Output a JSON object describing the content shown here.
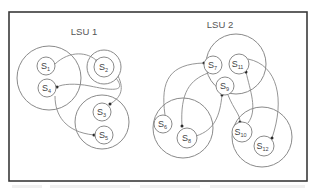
{
  "diagram": {
    "frame": {
      "x": 9,
      "y": 12,
      "width": 298,
      "height": 169,
      "color": "#3a3a3a"
    },
    "stroke_color": "#8a8a8a",
    "arrow_color": "#2b2b2b",
    "lsus": [
      {
        "id": "lsu1",
        "label": "LSU 1",
        "x": 84,
        "y": 35
      },
      {
        "id": "lsu2",
        "label": "LSU 2",
        "x": 220,
        "y": 28
      }
    ],
    "groups": [
      {
        "id": "g1",
        "lsu": "lsu1",
        "cx": 49,
        "cy": 78,
        "r": 32,
        "states": [
          "S1",
          "S4"
        ]
      },
      {
        "id": "g2",
        "lsu": "lsu1",
        "cx": 104,
        "cy": 67,
        "r": 17,
        "states": [
          "S2"
        ]
      },
      {
        "id": "g3",
        "lsu": "lsu1",
        "cx": 102,
        "cy": 122,
        "r": 27,
        "states": [
          "S3",
          "S5"
        ]
      },
      {
        "id": "g4",
        "lsu": "lsu2",
        "cx": 236,
        "cy": 64,
        "r": 30,
        "states": [
          "S7",
          "S11",
          "S9"
        ]
      },
      {
        "id": "g5",
        "lsu": "lsu2",
        "cx": 183,
        "cy": 128,
        "r": 30,
        "states": [
          "S6",
          "S8"
        ]
      },
      {
        "id": "g6",
        "lsu": "lsu2",
        "cx": 262,
        "cy": 137,
        "r": 30,
        "states": [
          "S10",
          "S12"
        ]
      }
    ],
    "states": [
      {
        "id": "S1",
        "base": "S",
        "sub": "1",
        "cx": 46,
        "cy": 66,
        "r": 9
      },
      {
        "id": "S4",
        "base": "S",
        "sub": "4",
        "cx": 47,
        "cy": 88,
        "r": 9
      },
      {
        "id": "S2",
        "base": "S",
        "sub": "2",
        "cx": 104,
        "cy": 67,
        "r": 10
      },
      {
        "id": "S3",
        "base": "S",
        "sub": "3",
        "cx": 102,
        "cy": 112,
        "r": 9
      },
      {
        "id": "S5",
        "base": "S",
        "sub": "5",
        "cx": 104,
        "cy": 135,
        "r": 9
      },
      {
        "id": "S7",
        "base": "S",
        "sub": "7",
        "cx": 213,
        "cy": 65,
        "r": 9
      },
      {
        "id": "S11",
        "base": "S",
        "sub": "11",
        "cx": 239,
        "cy": 64,
        "r": 10
      },
      {
        "id": "S9",
        "base": "S",
        "sub": "9",
        "cx": 225,
        "cy": 86,
        "r": 9
      },
      {
        "id": "S6",
        "base": "S",
        "sub": "6",
        "cx": 163,
        "cy": 124,
        "r": 9
      },
      {
        "id": "S8",
        "base": "S",
        "sub": "8",
        "cx": 187,
        "cy": 138,
        "r": 10
      },
      {
        "id": "S10",
        "base": "S",
        "sub": "10",
        "cx": 242,
        "cy": 132,
        "r": 10
      },
      {
        "id": "S12",
        "base": "S",
        "sub": "12",
        "cx": 264,
        "cy": 146,
        "r": 10
      }
    ],
    "edges": [
      {
        "from": "S1",
        "to": "S2",
        "path": "M55,64 C70,50 88,52 97,61",
        "arrow": [
          97,
          61
        ]
      },
      {
        "from": "S2",
        "to": "S4",
        "path": "M116,78 C125,90 118,92 90,86 C75,83 62,84 57,87",
        "arrow": [
          57,
          87
        ]
      },
      {
        "from": "S2",
        "to": "S3",
        "path": "M118,76 C125,90 120,98 110,104",
        "arrow": [
          110,
          104
        ]
      },
      {
        "from": "S4",
        "to": "S5",
        "path": "M55,96 C55,115 65,132 94,135",
        "arrow": [
          94,
          135
        ]
      },
      {
        "from": "S6",
        "to": "S7",
        "path": "M165,115 C160,80 170,64 204,63",
        "arrow": [
          204,
          63
        ]
      },
      {
        "from": "S7",
        "to": "S8",
        "path": "M208,73 C190,80 180,92 182,126",
        "arrow": [
          182,
          126
        ]
      },
      {
        "from": "S8",
        "to": "S9",
        "path": "M196,136 C215,130 220,115 222,95",
        "arrow": [
          222,
          95
        ]
      },
      {
        "from": "S9",
        "to": "S10",
        "path": "M228,95 C234,110 240,114 240,122",
        "arrow": [
          240,
          122
        ]
      },
      {
        "from": "S10",
        "to": "S11",
        "path": "M248,123 C258,110 250,90 246,72",
        "arrow": [
          246,
          72
        ]
      },
      {
        "from": "S11",
        "to": "S12",
        "path": "M248,59 C278,65 285,100 272,138",
        "arrow": [
          272,
          138
        ]
      }
    ]
  }
}
